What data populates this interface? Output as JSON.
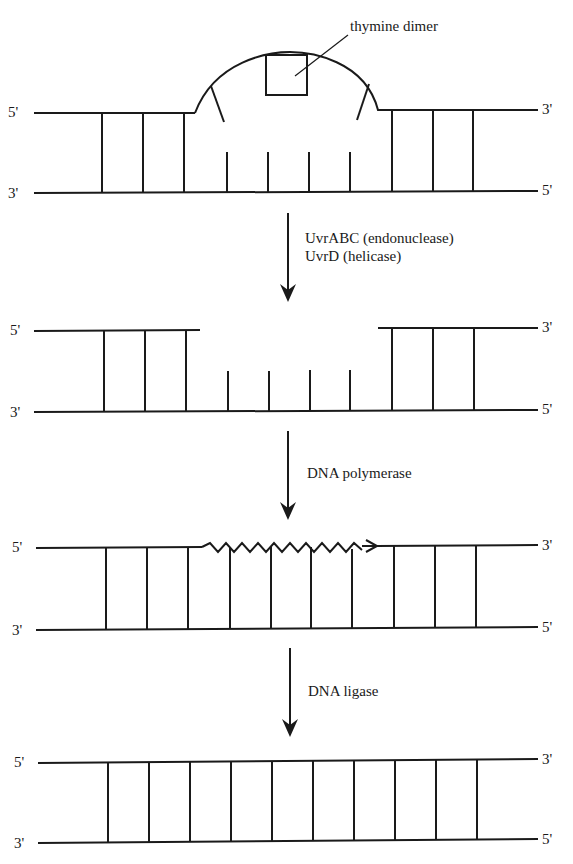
{
  "figure": {
    "stages": [
      {
        "id": "damaged",
        "left_top": "5'",
        "right_top": "3'",
        "left_bottom": "3'",
        "right_bottom": "5'",
        "annotation": "thymine dimer"
      },
      {
        "id": "excised",
        "left_top": "5'",
        "right_top": "3'",
        "left_bottom": "3'",
        "right_bottom": "5'"
      },
      {
        "id": "resynthesized",
        "left_top": "5'",
        "right_top": "3'",
        "left_bottom": "3'",
        "right_bottom": "5'"
      },
      {
        "id": "ligated",
        "left_top": "5'",
        "right_top": "3'",
        "left_bottom": "3'",
        "right_bottom": "5'"
      }
    ],
    "steps": [
      {
        "line1": "UvrABC (endonuclease)",
        "line2": "UvrD (helicase)"
      },
      {
        "line1": "DNA polymerase"
      },
      {
        "line1": "DNA ligase"
      }
    ]
  }
}
